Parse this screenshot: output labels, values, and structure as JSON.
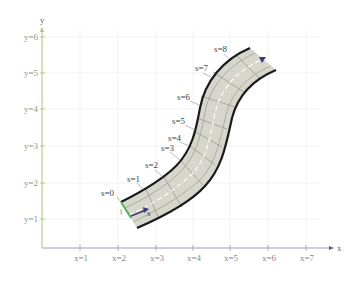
{
  "diagram": {
    "axes": {
      "x_name": "x",
      "y_name": "y",
      "x_ticks": [
        "x=1",
        "x=2",
        "x=3",
        "x=4",
        "x=5",
        "x=6",
        "x=7"
      ],
      "y_ticks": [
        "y=1",
        "y=2",
        "y=3",
        "y=4",
        "y=5",
        "y=6"
      ]
    },
    "road": {
      "s_labels": [
        "s=0",
        "s=1",
        "s=2",
        "s=3",
        "s=4",
        "s=5",
        "s=6",
        "s=7",
        "s=8"
      ],
      "s_axis_label": "s",
      "t_axis_label": "t"
    },
    "colors": {
      "road_fill": "#d6d6cc",
      "road_edge": "#1a1a1a",
      "y_axis": "#a8c47a",
      "x_axis": "#9aa0b8",
      "grid": "#eeeeee",
      "t_vector": "#4caf50",
      "s_vector": "#3a3a7a"
    }
  }
}
